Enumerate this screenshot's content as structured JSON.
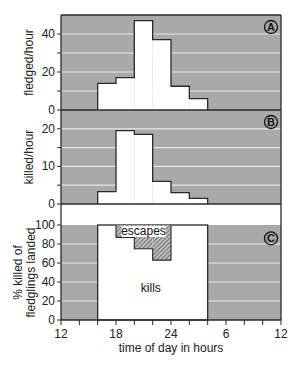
{
  "chart_data": [
    {
      "panel": "A",
      "type": "bar",
      "subtype": "histogram",
      "ylabel": "fledged/hour",
      "ylim": [
        0,
        50
      ],
      "yticks": [
        0,
        20,
        40
      ],
      "grid_values": [
        10,
        20,
        30,
        40
      ],
      "bins_hours": [
        [
          16,
          18
        ],
        [
          18,
          20
        ],
        [
          20,
          22
        ],
        [
          22,
          24
        ],
        [
          24,
          26
        ],
        [
          26,
          28
        ]
      ],
      "values": [
        14,
        17,
        47,
        37,
        12.5,
        6
      ],
      "panel_label": "A"
    },
    {
      "panel": "B",
      "type": "bar",
      "subtype": "histogram",
      "ylabel": "killed/hour",
      "ylim": [
        0,
        25
      ],
      "yticks": [
        0,
        10,
        20
      ],
      "grid_values": [
        5,
        10,
        15,
        20
      ],
      "bins_hours": [
        [
          16,
          18
        ],
        [
          18,
          20
        ],
        [
          20,
          22
        ],
        [
          22,
          24
        ],
        [
          24,
          26
        ],
        [
          26,
          28
        ]
      ],
      "values": [
        3.3,
        19.5,
        18.5,
        6,
        3,
        1.5
      ],
      "panel_label": "B"
    },
    {
      "panel": "C",
      "type": "bar",
      "subtype": "stacked-histogram",
      "ylabel_lines": [
        "% killed of",
        "fledglings landed"
      ],
      "ylim": [
        0,
        100
      ],
      "yticks": [
        0,
        20,
        40,
        60,
        80,
        100
      ],
      "grid_values": [
        20,
        40,
        60,
        80
      ],
      "kills_range_hours": [
        16,
        28
      ],
      "kills_value": 100,
      "escapes": {
        "bins_hours": [
          [
            18,
            20
          ],
          [
            20,
            22
          ],
          [
            22,
            24
          ]
        ],
        "lower_values": [
          87,
          75,
          63
        ],
        "upper_value": 100
      },
      "annotations": {
        "kills": "kills",
        "escapes": "escapes"
      },
      "panel_label": "C"
    }
  ],
  "xaxis": {
    "xlabel": "time of day in hours",
    "xlim_hours": [
      12,
      36
    ],
    "tick_step_hours": 2,
    "tick_labels": [
      {
        "hour": 12,
        "label": "12"
      },
      {
        "hour": 18,
        "label": "18"
      },
      {
        "hour": 24,
        "label": "24"
      },
      {
        "hour": 30,
        "label": "6"
      },
      {
        "hour": 36,
        "label": "12"
      }
    ]
  },
  "colors": {
    "background_shading": "#a9a9a9",
    "grid": "#e8e8e8",
    "bars": "#ffffff",
    "outline": "#2a2a2a",
    "escapes_hatch": "#555555"
  }
}
